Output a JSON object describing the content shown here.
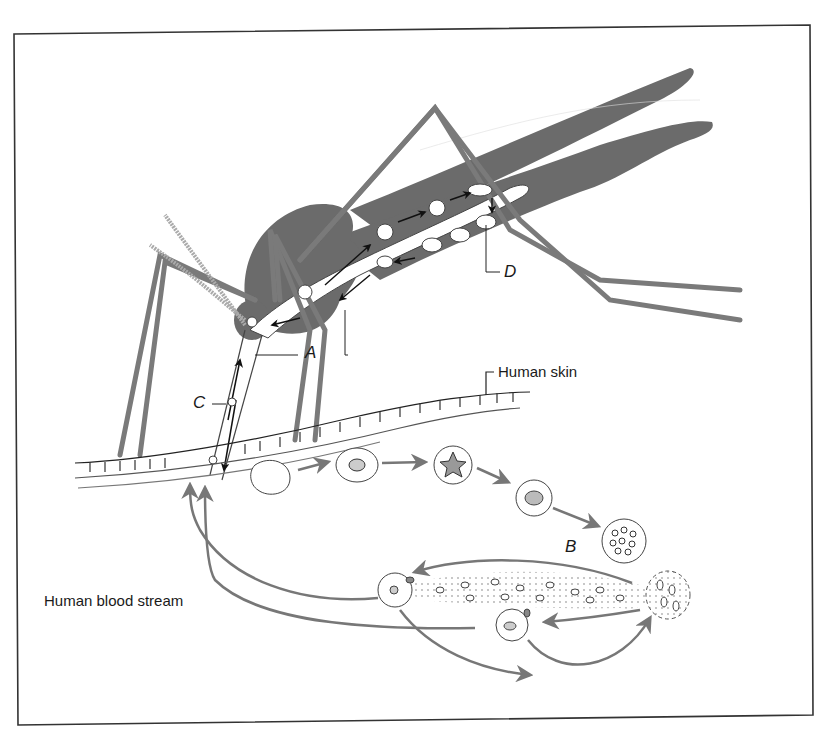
{
  "figure": {
    "border_color": "#333333",
    "mosquito_color": "#6b6b6b",
    "arrow_color": "#777777",
    "line_color": "#444444"
  },
  "labels": {
    "A": "A",
    "B": "B",
    "C": "C",
    "D": "D",
    "human_skin": "Human skin",
    "human_blood_stream": "Human blood stream"
  },
  "icons": [
    {
      "name": "mosquito-illustration"
    },
    {
      "name": "skin-layer"
    },
    {
      "name": "blood-cell-stage"
    },
    {
      "name": "flow-arrow"
    }
  ]
}
